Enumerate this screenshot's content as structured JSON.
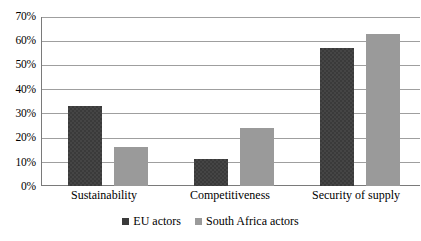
{
  "chart_data": {
    "type": "bar",
    "title": "",
    "subtitle": "",
    "xlabel": "",
    "ylabel": "",
    "categories": [
      "Sustainability",
      "Competitiveness",
      "Security of supply"
    ],
    "series": [
      {
        "name": "EU actors",
        "values": [
          33,
          11,
          57
        ],
        "color": "#3a3a3a"
      },
      {
        "name": "South Africa actors",
        "values": [
          16,
          24,
          63
        ],
        "color": "#9a9a9a"
      }
    ],
    "ylim": [
      0,
      70
    ],
    "ytick_values": [
      0,
      10,
      20,
      30,
      40,
      50,
      60,
      70
    ],
    "ytick_labels": [
      "0%",
      "10%",
      "20%",
      "30%",
      "40%",
      "50%",
      "60%",
      "70%"
    ],
    "value_format": "percent",
    "grid": "horizontal",
    "legend_position": "bottom-center",
    "legend_marker": "square",
    "axis_color": "#7a7a7a",
    "gridline_color": "#9f9f9f",
    "background": "#ffffff"
  }
}
